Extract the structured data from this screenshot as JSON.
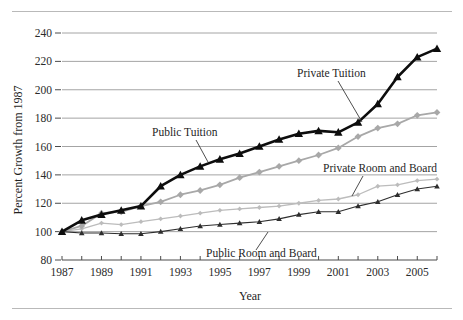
{
  "figure": {
    "has_top_rule": true,
    "has_bottom_rule": true,
    "background": "#ffffff"
  },
  "chart_data": {
    "type": "line",
    "title": "",
    "xlabel": "Year",
    "ylabel": "Percent Growth from 1987",
    "xlim": [
      1987,
      2006
    ],
    "ylim": [
      80,
      240
    ],
    "ytick_step": 20,
    "yticks": [
      80,
      100,
      120,
      140,
      160,
      180,
      200,
      220,
      240
    ],
    "ytick_labels": [
      "80",
      "100",
      "120",
      "140",
      "160",
      "180",
      "200",
      "220",
      "240"
    ],
    "x": [
      1987,
      1988,
      1989,
      1990,
      1991,
      1992,
      1993,
      1994,
      1995,
      1996,
      1997,
      1998,
      1999,
      2000,
      2001,
      2002,
      2003,
      2004,
      2005,
      2006
    ],
    "xticks": [
      1987,
      1988,
      1989,
      1990,
      1991,
      1992,
      1993,
      1994,
      1995,
      1996,
      1997,
      1998,
      1999,
      2000,
      2001,
      2002,
      2003,
      2004,
      2005,
      2006
    ],
    "xtick_labels": [
      "1987",
      "",
      "1989",
      "",
      "1991",
      "",
      "1993",
      "",
      "1995",
      "",
      "1997",
      "",
      "1999",
      "",
      "2001",
      "",
      "2003",
      "",
      "2005",
      ""
    ],
    "grid": "horizontal",
    "legend_position": "inline-annotations",
    "series": [
      {
        "name": "Public Tuition",
        "color": "#0d0d0d",
        "marker": "triangle",
        "line_width": 2.6,
        "values": [
          100,
          108,
          112,
          115,
          118,
          132,
          140,
          146,
          151,
          155,
          160,
          165,
          169,
          171,
          170,
          177,
          190,
          209,
          223,
          229
        ]
      },
      {
        "name": "Private Tuition",
        "color": "#a8a8a8",
        "marker": "diamond",
        "line_width": 1.8,
        "values": [
          100,
          104,
          113,
          114,
          118,
          121,
          126,
          129,
          133,
          138,
          142,
          146,
          150,
          154,
          159,
          167,
          173,
          176,
          182,
          184
        ]
      },
      {
        "name": "Private Room and Board",
        "color": "#bcbcbc",
        "marker": "diamond-small",
        "line_width": 1.3,
        "values": [
          100,
          102,
          106,
          105,
          107,
          109,
          111,
          113,
          115,
          116,
          117,
          118,
          120,
          122,
          123,
          126,
          132,
          133,
          136,
          137
        ]
      },
      {
        "name": "Public Room and Board",
        "color": "#2e2e2e",
        "marker": "triangle-small",
        "line_width": 1.1,
        "values": [
          100,
          99,
          99,
          98.5,
          98.5,
          100,
          102,
          104,
          105,
          106,
          107,
          109,
          112,
          114,
          114,
          118,
          121,
          126,
          130,
          132
        ]
      }
    ],
    "annotations": [
      {
        "label": "Public Tuition",
        "text_x": 152,
        "text_y": 136,
        "leader_from_x": 196,
        "leader_from_y": 140,
        "leader_to_x": 208,
        "leader_to_y": 162
      },
      {
        "label": "Private Tuition",
        "text_x": 297,
        "text_y": 77,
        "leader_from_x": 338,
        "leader_from_y": 81,
        "leader_to_x": 362,
        "leader_to_y": 122
      },
      {
        "label": "Private Room and Board",
        "text_x": 323,
        "text_y": 172,
        "leader_from_x": 363,
        "leader_from_y": 176,
        "leader_to_x": 352,
        "leader_to_y": 196
      },
      {
        "label": "Public Room and Board",
        "text_x": 206,
        "text_y": 257,
        "leader_from_x": 256,
        "leader_from_y": 250,
        "leader_to_x": 268,
        "leader_to_y": 232
      }
    ]
  }
}
